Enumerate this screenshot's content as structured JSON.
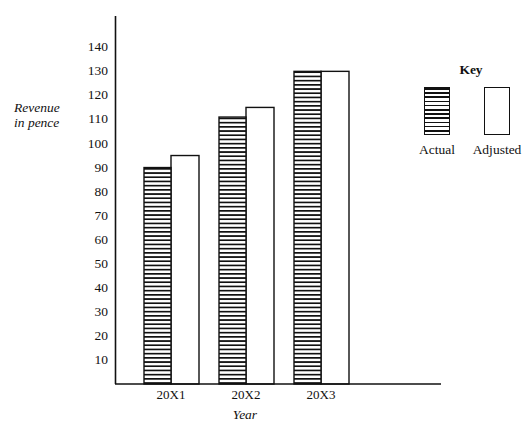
{
  "chart_data": {
    "type": "bar",
    "title": "",
    "subtitle": "",
    "xlabel": "Year",
    "ylabel": "Revenue\nin pence",
    "categories": [
      "20X1",
      "20X2",
      "20X3"
    ],
    "series": [
      {
        "name": "Actual",
        "values": [
          90,
          111,
          130
        ],
        "fill": "horizontal-hatch"
      },
      {
        "name": "Adjusted",
        "values": [
          95,
          115,
          130
        ],
        "fill": "white"
      }
    ],
    "ylim": [
      0,
      145
    ],
    "yticks": [
      10,
      20,
      30,
      40,
      50,
      60,
      70,
      80,
      90,
      100,
      110,
      120,
      130,
      140
    ],
    "ytick_labels": [
      "10",
      "20",
      "30",
      "40",
      "50",
      "60",
      "70",
      "80",
      "90",
      "100",
      "110",
      "120",
      "130",
      "140"
    ],
    "grid": false,
    "legend_position": "right",
    "axis_color": "#111111",
    "bar_edge_color": "#111111",
    "hatch_color": "#111111",
    "background": "#ffffff"
  },
  "legend": {
    "title": "Key",
    "entries": [
      {
        "label": "Actual",
        "swatch": "hatched-swatch"
      },
      {
        "label": "Adjusted",
        "swatch": "white-swatch"
      }
    ]
  },
  "axes": {
    "y_title": "Revenue\nin pence",
    "x_title": "Year"
  }
}
